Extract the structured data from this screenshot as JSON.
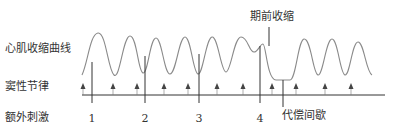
{
  "labels": {
    "contraction_curve": "心肌收缩曲线",
    "sinus_rhythm": "窦性节律",
    "extra_stimulus": "额外刺激",
    "premature_contraction": "期前收缩",
    "compensatory_pause": "代偿间歇"
  },
  "stimuli": [
    {
      "label": "1",
      "x": 92,
      "top": 62
    },
    {
      "label": "2",
      "x": 145,
      "top": 56
    },
    {
      "label": "3",
      "x": 199,
      "top": 54
    },
    {
      "label": "4",
      "x": 260,
      "top": 46
    }
  ],
  "sinus_arrows_x": [
    83,
    113,
    137,
    164,
    188,
    217,
    243,
    272,
    296,
    325,
    351
  ],
  "colors": {
    "curve": "#8a8a8a",
    "lines": "#333333",
    "arrows": "#444444",
    "text": "#333333"
  }
}
